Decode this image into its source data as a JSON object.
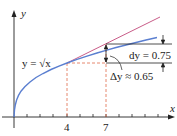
{
  "diagram": {
    "axes": {
      "x_label": "x",
      "y_label": "y"
    },
    "curve_label": "y = √x",
    "tick_labels": {
      "a": "4",
      "b": "7"
    },
    "annotations": {
      "dy": "dy = 0.75",
      "delta_y": "Δy ≈ 0.65"
    },
    "colors": {
      "curve": "#5b7fd0",
      "tangent": "#c24a7a",
      "guide": "#e06a4a",
      "axis": "#222222"
    }
  }
}
